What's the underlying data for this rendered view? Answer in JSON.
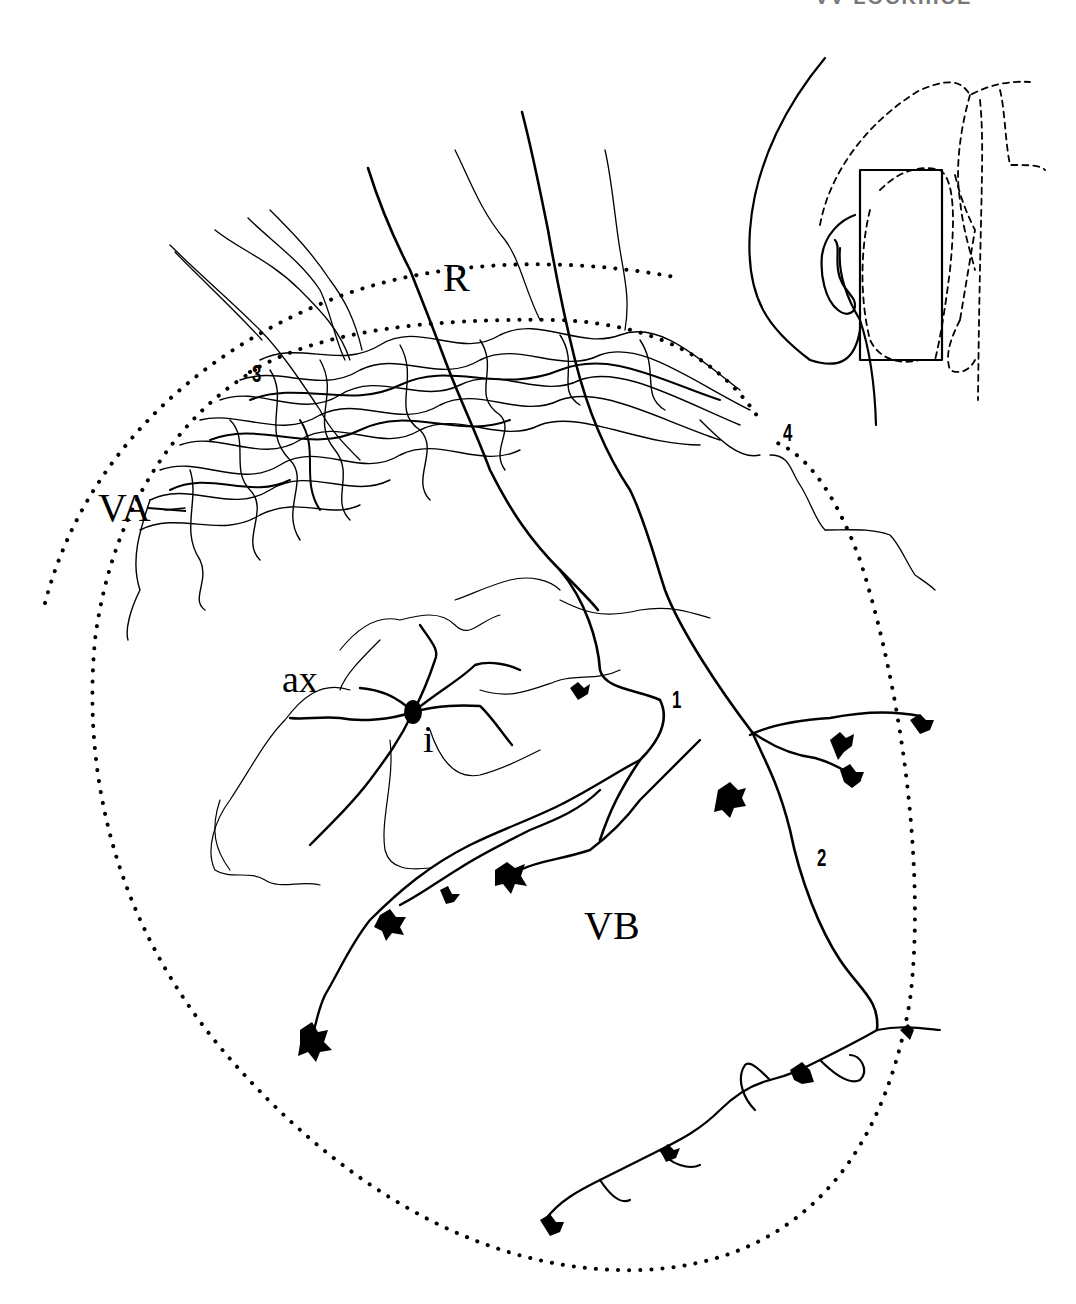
{
  "figure": {
    "header_fragment": "VV LOCKIIICE",
    "region_labels": {
      "R": "R",
      "VA": "VA",
      "VB": "VB",
      "ax": "ax",
      "i": "i"
    },
    "axon_numbers": [
      "1",
      "2",
      "3",
      "4"
    ],
    "inset": {
      "description": "Orientation inset: brain section outline with rectangle marking drawn area",
      "has_rectangle": true
    },
    "boundaries": {
      "style": "dotted",
      "regions": [
        "R",
        "VA",
        "VB"
      ]
    },
    "colors": {
      "ink": "#000000",
      "background": "#ffffff"
    }
  }
}
